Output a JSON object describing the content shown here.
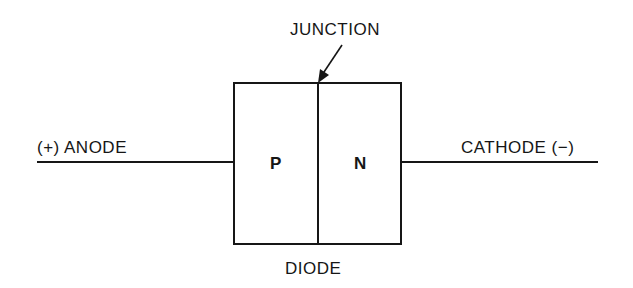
{
  "diagram": {
    "title": "DIODE",
    "junction_label": "JUNCTION",
    "anode_label": "(+) ANODE",
    "cathode_label": "CATHODE (−)",
    "regions": [
      {
        "id": "p",
        "label": "P"
      },
      {
        "id": "n",
        "label": "N"
      }
    ],
    "colors": {
      "line": "#161616",
      "background": "#ffffff"
    }
  }
}
